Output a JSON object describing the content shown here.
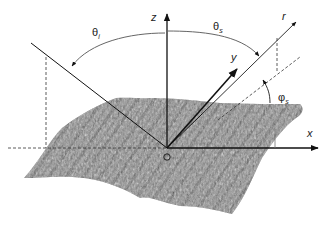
{
  "diagram": {
    "type": "scattering-geometry",
    "axes": {
      "x_label": "x",
      "y_label": "y",
      "z_label": "z",
      "origin_label": "O"
    },
    "vectors": {
      "scattered_label": "r"
    },
    "angles": {
      "theta_i": {
        "symbol": "θ",
        "sub": "i"
      },
      "theta_s": {
        "symbol": "θ",
        "sub": "s"
      },
      "phi_s": {
        "symbol": "φ",
        "sub": "s"
      }
    },
    "colors": {
      "surface_dark": "#3c3c3c",
      "surface_mid": "#8a8a8a",
      "surface_light": "#b4b4b4",
      "line": "#111111",
      "arc": "#666666",
      "dashed": "#333333"
    }
  }
}
